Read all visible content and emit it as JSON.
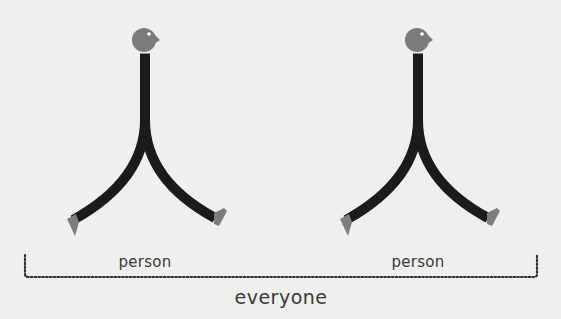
{
  "diagram": {
    "figures": [
      {
        "id": "person-1",
        "label": "person",
        "center_x": 145
      },
      {
        "id": "person-2",
        "label": "person",
        "center_x": 418
      }
    ],
    "group_label": "everyone",
    "colors": {
      "background": "#efefee",
      "body": "#1b1b1b",
      "head": "#7b7b7b",
      "feet": "#7d7d7d",
      "eye": "#ffffff",
      "text": "#3a3a3a",
      "bracket": "#2e2e2e"
    }
  }
}
